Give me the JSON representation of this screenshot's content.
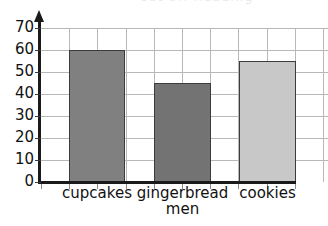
{
  "chart_data": {
    "type": "bar",
    "title": "",
    "xlabel": "",
    "ylabel": "",
    "categories": [
      "cupcakes",
      "gingerbread\nmen",
      "cookies"
    ],
    "values": [
      60,
      45,
      55
    ],
    "ylim": [
      0,
      70
    ],
    "ytick_step": 10,
    "yticks": [
      0,
      10,
      20,
      30,
      40,
      50,
      60,
      70
    ],
    "ytick_labels": [
      "0",
      "10",
      "20",
      "30",
      "40",
      "50",
      "60",
      "70"
    ],
    "grid": true,
    "legend": "none",
    "bar_colors": [
      "#808080",
      "#737373",
      "#c8c8c8"
    ],
    "bar_outline_color": "#3c3c3c",
    "axis_color": "#1a1a1a",
    "grid_color": "#b8b8b8",
    "series": [
      {
        "name": "",
        "values": [
          60,
          45,
          55
        ]
      }
    ]
  },
  "title_remnant": {
    "ghost_text": "cut off heading"
  }
}
